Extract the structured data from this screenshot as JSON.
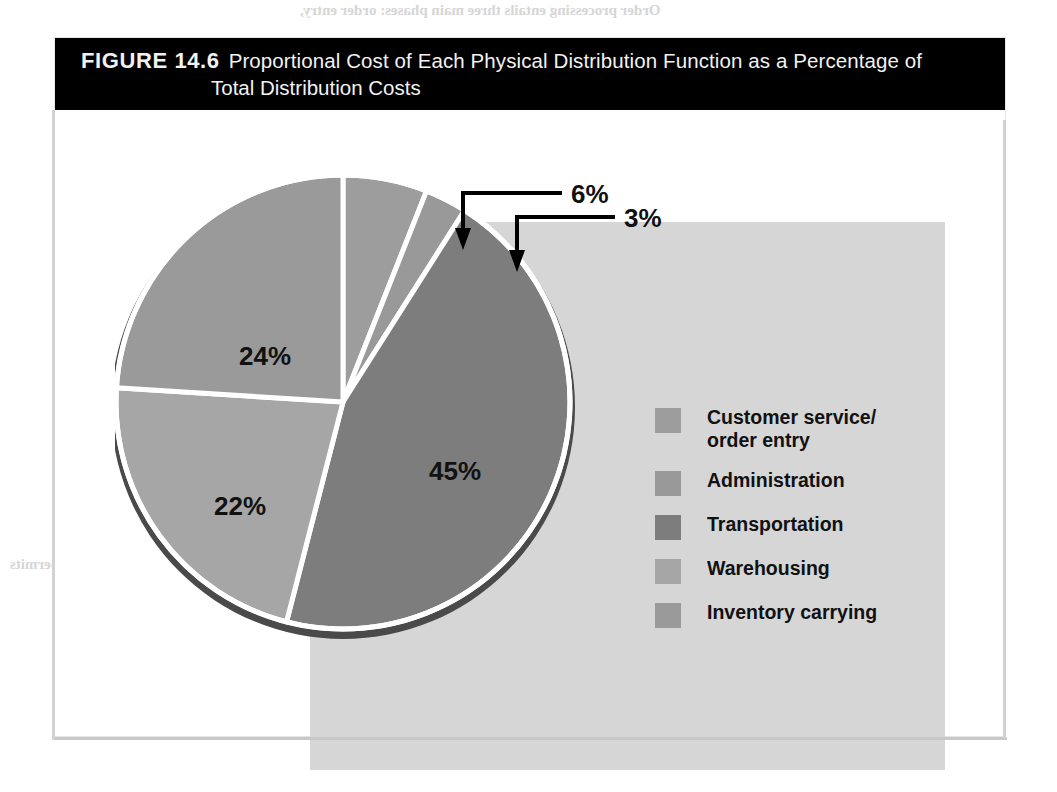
{
  "figure": {
    "label": "FIGURE 14.6",
    "caption_line1": "Proportional Cost of Each Physical Distribution Function as a Percentage of",
    "caption_line2": "Total Distribution Costs"
  },
  "colors": {
    "title_bar_background": "#000000",
    "title_text": "#f2f2f2",
    "panel_background": "#ffffff",
    "plot_background": "#d6d6d6",
    "slice_customer_service": "#9d9d9d",
    "slice_administration": "#999999",
    "slice_transportation": "#7d7d7d",
    "slice_warehousing": "#a6a6a6",
    "slice_inventory_carrying": "#9a9a9a",
    "slice_divider": "#ffffff",
    "pie_shadow": "#4a4a4a",
    "label_text": "#111111",
    "callout_line": "#000000"
  },
  "chart_data": {
    "type": "pie",
    "title": "Proportional Cost of Each Physical Distribution Function as a Percentage of Total Distribution Costs",
    "legend_position": "right",
    "start_angle_deg": 0,
    "direction": "clockwise",
    "categories": [
      "Customer service/\norder entry",
      "Administration",
      "Transportation",
      "Warehousing",
      "Inventory carrying"
    ],
    "values": [
      6,
      3,
      45,
      22,
      24
    ],
    "value_labels": [
      "6%",
      "3%",
      "45%",
      "22%",
      "24%"
    ],
    "unit": "%",
    "slices": [
      {
        "name": "Customer service/\norder entry",
        "value": 6,
        "label": "6%",
        "color": "#9d9d9d",
        "label_style": "callout"
      },
      {
        "name": "Administration",
        "value": 3,
        "label": "3%",
        "color": "#999999",
        "label_style": "callout"
      },
      {
        "name": "Transportation",
        "value": 45,
        "label": "45%",
        "color": "#7d7d7d",
        "label_style": "inside"
      },
      {
        "name": "Warehousing",
        "value": 22,
        "label": "22%",
        "color": "#a6a6a6",
        "label_style": "inside"
      },
      {
        "name": "Inventory carrying",
        "value": 24,
        "label": "24%",
        "color": "#9a9a9a",
        "label_style": "inside"
      }
    ]
  },
  "labels": {
    "customer_service": "6%",
    "administration": "3%",
    "transportation": "45%",
    "warehousing": "22%",
    "inventory_carrying": "24%"
  },
  "legend": {
    "items": [
      {
        "label": "Customer service/\norder entry",
        "color": "#9d9d9d"
      },
      {
        "label": "Administration",
        "color": "#999999"
      },
      {
        "label": "Transportation",
        "color": "#7d7d7d"
      },
      {
        "label": "Warehousing",
        "color": "#a6a6a6"
      },
      {
        "label": "Inventory carrying",
        "color": "#9a9a9a"
      }
    ]
  },
  "page_bleed": {
    "lines": [
      "Order processing entails three main phases: order entry,",
      "order handling, and order delivery. Order entry",
      "begins when customers or their sales representatives place",
      "purchase orders, inquire about the status of orders,",
      "or request products. Order handling involves",
      "locating, assembling, and moving products into distribution.",
      "Electronic data interchange (EDI) permits",
      "companies to integrate order processing with production,",
      "inventory, accounting, and transportation."
    ]
  }
}
